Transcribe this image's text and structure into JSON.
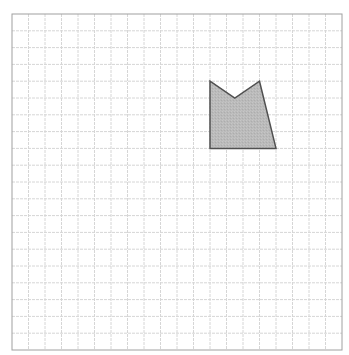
{
  "grid": {
    "left": 12,
    "top": 14,
    "width": 330,
    "height": 336,
    "columns": 20,
    "rows": 20,
    "line_color": "#d6d6d6",
    "border_color": "#a0a0a0"
  },
  "shape": {
    "name": "pentagon-notched",
    "points_grid": [
      [
        12,
        4
      ],
      [
        13.5,
        5
      ],
      [
        15,
        4
      ],
      [
        16,
        8
      ],
      [
        12,
        8
      ]
    ],
    "fill": "#b9b9b9",
    "stroke": "#505050"
  }
}
